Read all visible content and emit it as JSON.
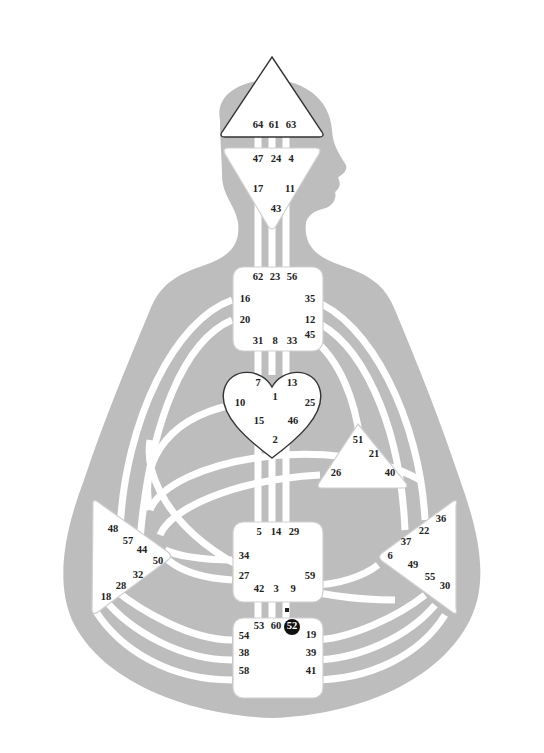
{
  "diagram": {
    "type": "human-design-bodygraph",
    "colors": {
      "silhouette": "#bdbdbd",
      "channel": "#ffffff",
      "center_fill": "#ffffff",
      "text": "#222222",
      "active_gate_fill": "#111111"
    },
    "centers": {
      "head": {
        "gates": [
          "64",
          "61",
          "63"
        ]
      },
      "ajna": {
        "gates": [
          "47",
          "24",
          "4",
          "17",
          "11",
          "43"
        ]
      },
      "throat": {
        "gates": [
          "62",
          "23",
          "56",
          "16",
          "35",
          "20",
          "12",
          "45",
          "31",
          "8",
          "33"
        ]
      },
      "g_center": {
        "gates": [
          "7",
          "1",
          "13",
          "10",
          "25",
          "15",
          "46",
          "2"
        ]
      },
      "heart": {
        "gates": [
          "51",
          "21",
          "26",
          "40"
        ]
      },
      "spleen": {
        "gates": [
          "48",
          "57",
          "44",
          "50",
          "32",
          "28",
          "18"
        ]
      },
      "sacral": {
        "gates": [
          "5",
          "14",
          "29",
          "34",
          "27",
          "59",
          "42",
          "3",
          "9"
        ]
      },
      "solar_plexus": {
        "gates": [
          "36",
          "22",
          "37",
          "6",
          "49",
          "55",
          "30"
        ]
      },
      "root": {
        "gates": [
          "53",
          "60",
          "52",
          "54",
          "19",
          "38",
          "39",
          "58",
          "41"
        ]
      }
    },
    "active_gate": "52"
  }
}
